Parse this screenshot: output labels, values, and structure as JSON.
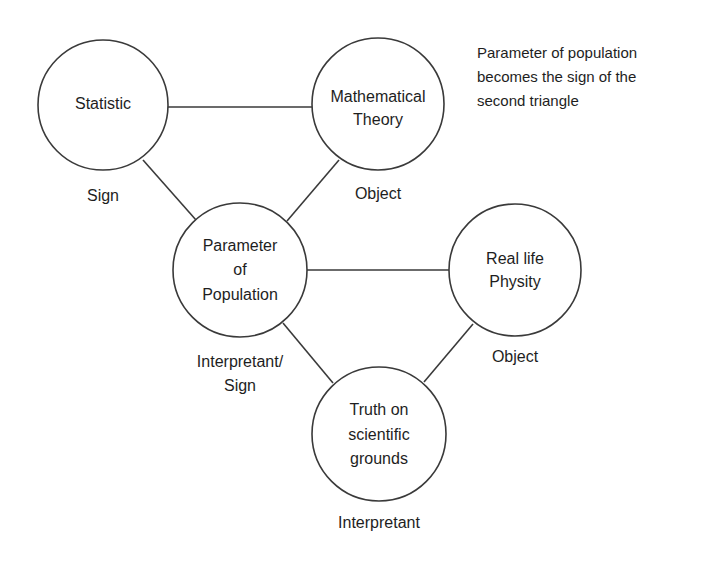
{
  "diagram": {
    "nodes": [
      {
        "id": "statistic",
        "lines": [
          "Statistic"
        ],
        "role": [
          "Sign"
        ]
      },
      {
        "id": "mathematical-theory",
        "lines": [
          "Mathematical",
          "Theory"
        ],
        "role": [
          "Object"
        ]
      },
      {
        "id": "parameter-of-population",
        "lines": [
          "Parameter",
          "of",
          "Population"
        ],
        "role": [
          "Interpretant/",
          "Sign"
        ]
      },
      {
        "id": "real-life-physity",
        "lines": [
          "Real life",
          "Physity"
        ],
        "role": [
          "Object"
        ]
      },
      {
        "id": "truth-on-scientific-grounds",
        "lines": [
          "Truth on",
          "scientific",
          "grounds"
        ],
        "role": [
          "Interpretant"
        ]
      }
    ],
    "edges": [
      [
        "statistic",
        "mathematical-theory"
      ],
      [
        "statistic",
        "parameter-of-population"
      ],
      [
        "mathematical-theory",
        "parameter-of-population"
      ],
      [
        "parameter-of-population",
        "real-life-physity"
      ],
      [
        "parameter-of-population",
        "truth-on-scientific-grounds"
      ],
      [
        "real-life-physity",
        "truth-on-scientific-grounds"
      ]
    ],
    "note": [
      "Parameter of population",
      "becomes the sign of the",
      "second triangle"
    ]
  },
  "colors": {
    "stroke": "#3a3a3a",
    "text": "#1e1e1e",
    "background": "#ffffff"
  }
}
